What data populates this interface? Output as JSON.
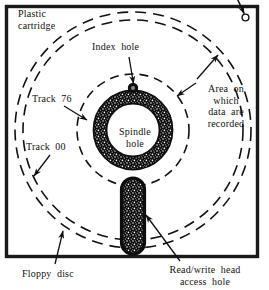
{
  "figure": {
    "colors": {
      "ink": "#111111",
      "frame": "#1a1a1a",
      "background": "#ffffff"
    }
  },
  "labels": {
    "plastic_cartridge": "Plastic\ncartridge",
    "index_hole": "Index  hole",
    "area_recorded": "Area  on\nwhich\ndata  are\nrecorded",
    "track_76": "Track  76",
    "track_00": "Track  00",
    "spindle_hole": "Spindle\nhole",
    "floppy_disc": "Floppy  disc",
    "read_write_head": "Read/write  head\naccess  hole"
  },
  "parts": [
    {
      "name": "plastic-cartridge",
      "label": "Plastic cartridge",
      "shape": "square-frame"
    },
    {
      "name": "write-protect-hole",
      "label": "",
      "shape": "small-circle"
    },
    {
      "name": "floppy-disc",
      "label": "Floppy disc",
      "shape": "dashed-circle-outer"
    },
    {
      "name": "track-00",
      "label": "Track 00",
      "shape": "dashed-circle"
    },
    {
      "name": "track-76",
      "label": "Track 76",
      "shape": "dashed-circle-inner"
    },
    {
      "name": "area-recorded",
      "label": "Area on which data are recorded",
      "shape": "annulus"
    },
    {
      "name": "index-hole",
      "label": "Index hole",
      "shape": "small-filled-circle"
    },
    {
      "name": "spindle-hole",
      "label": "Spindle hole",
      "shape": "thick-ring"
    },
    {
      "name": "read-write-head-access-hole",
      "label": "Read/write head access hole",
      "shape": "capsule"
    }
  ]
}
